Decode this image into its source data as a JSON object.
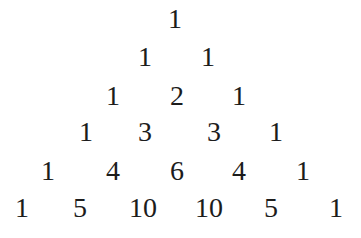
{
  "text_color": "#1c1c1c",
  "background": "#ffffff",
  "rows": [
    {
      "y": 19,
      "values": [
        "1"
      ],
      "x": [
        175
      ]
    },
    {
      "y": 57,
      "values": [
        "1",
        "1"
      ],
      "x": [
        145,
        208
      ]
    },
    {
      "y": 96,
      "values": [
        "1",
        "2",
        "1"
      ],
      "x": [
        113,
        177,
        239
      ]
    },
    {
      "y": 132,
      "values": [
        "1",
        "3",
        "3",
        "1"
      ],
      "x": [
        86,
        145,
        214,
        276
      ]
    },
    {
      "y": 171,
      "values": [
        "1",
        "4",
        "6",
        "4",
        "1"
      ],
      "x": [
        48,
        113,
        177,
        239,
        303
      ]
    },
    {
      "y": 208,
      "values": [
        "1",
        "5",
        "10",
        "10",
        "5",
        "1"
      ],
      "x": [
        22,
        80,
        143,
        209,
        271,
        336
      ]
    }
  ]
}
